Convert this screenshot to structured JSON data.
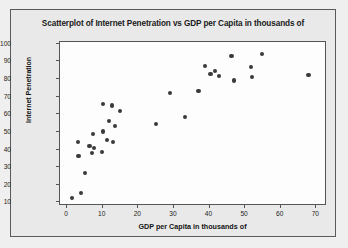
{
  "chart_data": {
    "type": "scatter",
    "title": "Scatterplot of Internet Penetration vs GDP per Capita in thousands of",
    "xlabel": "GDP per Capita in thousands of",
    "ylabel": "Internet Penetration",
    "xlim": [
      -2,
      73
    ],
    "ylim": [
      8,
      101
    ],
    "xticks": [
      0,
      10,
      20,
      30,
      40,
      50,
      60,
      70
    ],
    "yticks": [
      10,
      20,
      30,
      40,
      50,
      60,
      70,
      80,
      90,
      100
    ],
    "grid": false,
    "legend": null,
    "marker_color": "#3a3a3a",
    "points": [
      {
        "x": 1.3,
        "y": 12.5
      },
      {
        "x": 4.0,
        "y": 15.3
      },
      {
        "x": 5.0,
        "y": 26.5
      },
      {
        "x": 3.0,
        "y": 44.2
      },
      {
        "x": 3.2,
        "y": 36.3
      },
      {
        "x": 6.3,
        "y": 42.2
      },
      {
        "x": 7.0,
        "y": 38.2
      },
      {
        "x": 7.6,
        "y": 40.8
      },
      {
        "x": 7.3,
        "y": 49.0
      },
      {
        "x": 9.8,
        "y": 38.6
      },
      {
        "x": 10.0,
        "y": 50.2
      },
      {
        "x": 10.1,
        "y": 66.0
      },
      {
        "x": 11.3,
        "y": 45.3
      },
      {
        "x": 11.7,
        "y": 56.1
      },
      {
        "x": 12.6,
        "y": 65.0
      },
      {
        "x": 13.0,
        "y": 44.5
      },
      {
        "x": 13.4,
        "y": 53.4
      },
      {
        "x": 14.8,
        "y": 61.7
      },
      {
        "x": 25.0,
        "y": 54.5
      },
      {
        "x": 29.0,
        "y": 72.2
      },
      {
        "x": 33.0,
        "y": 58.6
      },
      {
        "x": 36.9,
        "y": 73.0
      },
      {
        "x": 38.8,
        "y": 87.2
      },
      {
        "x": 40.3,
        "y": 82.8
      },
      {
        "x": 41.5,
        "y": 84.5
      },
      {
        "x": 42.6,
        "y": 81.9
      },
      {
        "x": 46.2,
        "y": 93.2
      },
      {
        "x": 46.9,
        "y": 79.2
      },
      {
        "x": 51.7,
        "y": 87.0
      },
      {
        "x": 51.9,
        "y": 81.2
      },
      {
        "x": 54.8,
        "y": 94.3
      },
      {
        "x": 67.8,
        "y": 82.5
      }
    ]
  }
}
